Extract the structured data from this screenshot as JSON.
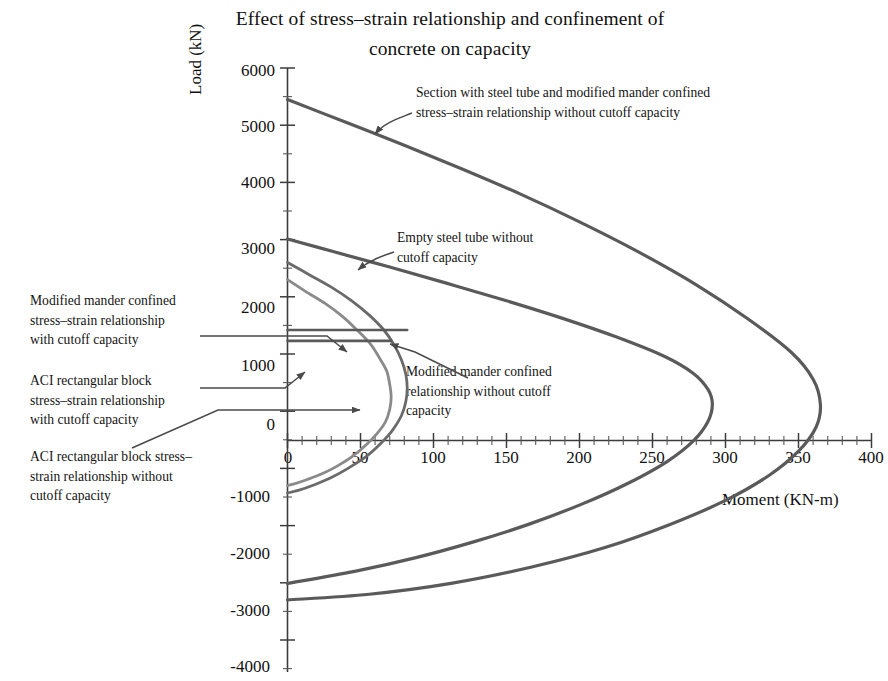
{
  "chart": {
    "title_line1": "Effect of stress–strain relationship and confinement of",
    "title_line2": "concrete on capacity",
    "xlabel": "Moment (KN-m)",
    "ylabel": "Load (kN)"
  },
  "ticks": {
    "x": [
      "0",
      "50",
      "100",
      "150",
      "200",
      "250",
      "300",
      "350",
      "400"
    ],
    "y": [
      "6000",
      "5000",
      "4000",
      "3000",
      "2000",
      "1000",
      "0",
      "-1000",
      "-2000",
      "-3000",
      "-4000"
    ]
  },
  "annotations": {
    "a1_line1": "Section with steel tube and modified mander confined",
    "a1_line2": "stress–strain relationship without cutoff capacity",
    "a2_line1": "Empty steel tube without",
    "a2_line2": "cutoff capacity",
    "a3_line1": "Modified mander confined",
    "a3_line2": "stress–strain relationship",
    "a3_line3": "with cutoff capacity",
    "a4_line1": "ACI rectangular block",
    "a4_line2": "stress–strain relationship",
    "a4_line3": "with cutoff capacity",
    "a5_line1": "ACI rectangular block stress–",
    "a5_line2": "strain relationship without",
    "a5_line3": "cutoff capacity",
    "a6_line1": "Modified mander confined",
    "a6_line2": "relationship without cutoff",
    "a6_line3": "capacity"
  },
  "colors": {
    "curve": "#5a5a5a",
    "curve_light": "#7d7d7d",
    "axis": "#3c3c3c",
    "leader": "#4a4a4a",
    "text": "#111111",
    "background": "#ffffff"
  },
  "chart_data": {
    "type": "line",
    "title": "Effect of stress–strain relationship and confinement of concrete on capacity",
    "xlabel": "Moment (KN-m)",
    "ylabel": "Load (kN)",
    "xlim": [
      0,
      400
    ],
    "ylim": [
      -4000,
      6000
    ],
    "xticks": [
      0,
      50,
      100,
      150,
      200,
      250,
      300,
      350,
      400
    ],
    "yticks": [
      6000,
      5000,
      4000,
      3000,
      2000,
      1000,
      0,
      -1000,
      -2000,
      -3000,
      -4000
    ],
    "grid": false,
    "legend": "annotations-with-leader-lines",
    "series": [
      {
        "name": "Section with steel tube and modified mander confined stress–strain relationship without cutoff capacity",
        "color": "#5a5a5a",
        "points": [
          [
            0,
            5450
          ],
          [
            40,
            5050
          ],
          [
            80,
            4650
          ],
          [
            120,
            4230
          ],
          [
            160,
            3790
          ],
          [
            200,
            3310
          ],
          [
            240,
            2790
          ],
          [
            280,
            2210
          ],
          [
            315,
            1620
          ],
          [
            345,
            1030
          ],
          [
            360,
            560
          ],
          [
            365,
            120
          ],
          [
            362,
            -280
          ],
          [
            350,
            -700
          ],
          [
            330,
            -1120
          ],
          [
            300,
            -1560
          ],
          [
            262,
            -1980
          ],
          [
            218,
            -2380
          ],
          [
            168,
            -2720
          ],
          [
            112,
            -3010
          ],
          [
            56,
            -3200
          ],
          [
            0,
            -3300
          ]
        ]
      },
      {
        "name": "Empty steel tube without cutoff capacity",
        "color": "#5a5a5a",
        "points": [
          [
            0,
            3010
          ],
          [
            30,
            2800
          ],
          [
            70,
            2520
          ],
          [
            110,
            2230
          ],
          [
            150,
            1930
          ],
          [
            190,
            1610
          ],
          [
            225,
            1300
          ],
          [
            258,
            960
          ],
          [
            278,
            660
          ],
          [
            288,
            380
          ],
          [
            291,
            120
          ],
          [
            288,
            -180
          ],
          [
            278,
            -520
          ],
          [
            260,
            -880
          ],
          [
            234,
            -1250
          ],
          [
            202,
            -1620
          ],
          [
            166,
            -1970
          ],
          [
            128,
            -2280
          ],
          [
            88,
            -2560
          ],
          [
            46,
            -2800
          ],
          [
            0,
            -3010
          ]
        ]
      },
      {
        "name": "Modified mander confined relationship without cutoff capacity",
        "color": "#6a6a6a",
        "points": [
          [
            0,
            2600
          ],
          [
            14,
            2400
          ],
          [
            30,
            2170
          ],
          [
            44,
            1930
          ],
          [
            56,
            1680
          ],
          [
            66,
            1420
          ],
          [
            73,
            1160
          ],
          [
            78,
            900
          ],
          [
            81,
            650
          ],
          [
            82,
            400
          ],
          [
            81,
            160
          ],
          [
            78,
            -80
          ],
          [
            72,
            -330
          ],
          [
            64,
            -560
          ],
          [
            54,
            -790
          ],
          [
            42,
            -990
          ],
          [
            30,
            -1160
          ],
          [
            18,
            -1290
          ],
          [
            8,
            -1380
          ],
          [
            0,
            -1430
          ]
        ]
      },
      {
        "name": "ACI rectangular block stress–strain relationship without cutoff capacity",
        "color": "#8a8a8a",
        "points": [
          [
            0,
            2300
          ],
          [
            12,
            2100
          ],
          [
            26,
            1880
          ],
          [
            38,
            1650
          ],
          [
            48,
            1410
          ],
          [
            57,
            1170
          ],
          [
            63,
            930
          ],
          [
            68,
            700
          ],
          [
            70,
            470
          ],
          [
            71,
            250
          ],
          [
            70,
            30
          ],
          [
            67,
            -190
          ],
          [
            61,
            -400
          ],
          [
            53,
            -610
          ],
          [
            44,
            -800
          ],
          [
            34,
            -960
          ],
          [
            24,
            -1090
          ],
          [
            14,
            -1190
          ],
          [
            6,
            -1260
          ],
          [
            0,
            -1300
          ]
        ]
      },
      {
        "name": "Modified mander confined stress–strain relationship with cutoff capacity (horizontal cutoff)",
        "color": "#5a5a5a",
        "type": "cutoff-line",
        "points": [
          [
            0,
            1420
          ],
          [
            82,
            1420
          ]
        ]
      },
      {
        "name": "ACI rectangular block stress–strain relationship with cutoff capacity (horizontal cutoff)",
        "color": "#5a5a5a",
        "type": "cutoff-line",
        "points": [
          [
            0,
            1230
          ],
          [
            71,
            1230
          ]
        ]
      }
    ]
  }
}
